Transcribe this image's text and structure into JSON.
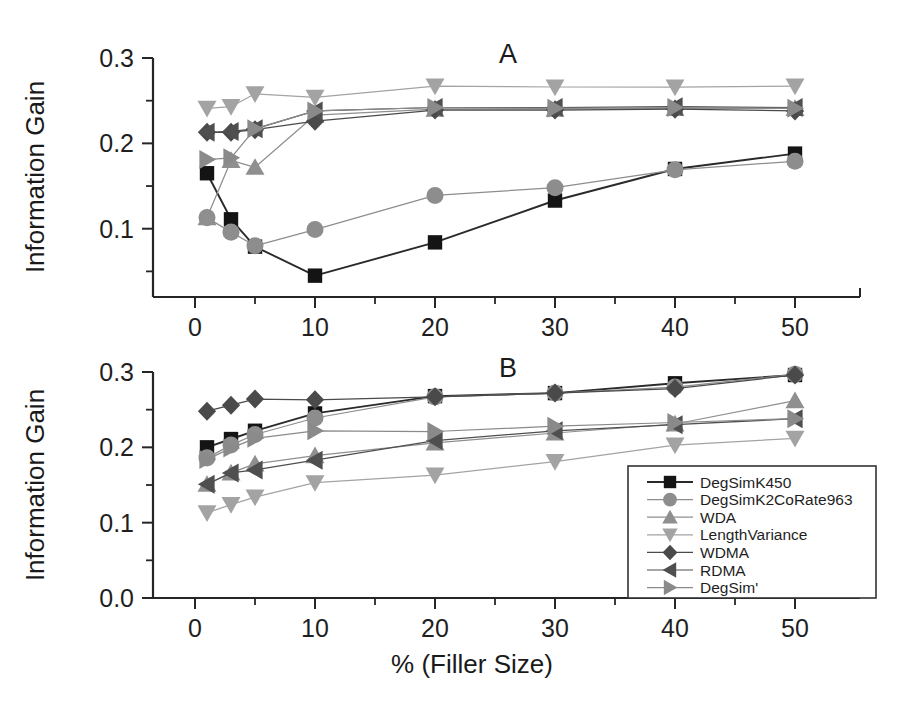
{
  "figure": {
    "width": 901,
    "height": 711,
    "background": "#ffffff"
  },
  "axis_labels": {
    "y_title": "Information Gain",
    "x_title": "% (Filler Size)"
  },
  "panels": [
    {
      "id": "A",
      "letter": "A"
    },
    {
      "id": "B",
      "letter": "B"
    }
  ],
  "legend": {
    "position": "bottom-right",
    "entries": [
      {
        "label": "DegSimK450",
        "marker": "square",
        "color": "#141414"
      },
      {
        "label": "DegSimK2CoRate963",
        "marker": "circle",
        "color": "#8d8d8d"
      },
      {
        "label": "WDA",
        "marker": "triangle-up",
        "color": "#8f8f8f"
      },
      {
        "label": "LengthVariance",
        "marker": "triangle-down",
        "color": "#a3a3a3"
      },
      {
        "label": "WDMA",
        "marker": "diamond",
        "color": "#4a4a4a"
      },
      {
        "label": "RDMA",
        "marker": "triangle-left",
        "color": "#4f4f4f"
      },
      {
        "label": "DegSim'",
        "marker": "triangle-right",
        "color": "#8a8a8a"
      }
    ]
  },
  "chart_data": [
    {
      "type": "line",
      "panel": "A",
      "title": "A",
      "xlabel": "% (Filler Size)",
      "ylabel": "Information Gain",
      "x": [
        1,
        3,
        5,
        10,
        20,
        30,
        40,
        50
      ],
      "xlim": [
        -2,
        54
      ],
      "ylim": [
        0.02,
        0.3
      ],
      "xticks": [
        0,
        10,
        20,
        30,
        40,
        50
      ],
      "yticks": [
        0.1,
        0.2,
        0.3
      ],
      "yticklabels": [
        "0.1",
        "0.2",
        "0.3"
      ],
      "minor_xticks": [
        5,
        15,
        25,
        35,
        45
      ],
      "minor_yticks": [
        0.05,
        0.15,
        0.25
      ],
      "grid": false,
      "legend": false,
      "series": [
        {
          "name": "DegSimK450",
          "marker": "square",
          "color": "#141414",
          "values": [
            0.165,
            0.111,
            0.079,
            0.045,
            0.084,
            0.133,
            0.17,
            0.188
          ]
        },
        {
          "name": "DegSimK2CoRate963",
          "marker": "circle",
          "color": "#8d8d8d",
          "values": [
            0.113,
            0.096,
            0.08,
            0.099,
            0.139,
            0.148,
            0.169,
            0.179
          ]
        },
        {
          "name": "WDA",
          "marker": "triangle-up",
          "color": "#8f8f8f",
          "values": [
            0.113,
            0.18,
            0.172,
            0.233,
            0.24,
            0.24,
            0.241,
            0.241
          ]
        },
        {
          "name": "LengthVariance",
          "marker": "triangle-down",
          "color": "#a3a3a3",
          "values": [
            0.241,
            0.243,
            0.258,
            0.254,
            0.267,
            0.266,
            0.266,
            0.267
          ]
        },
        {
          "name": "WDMA",
          "marker": "diamond",
          "color": "#4a4a4a",
          "values": [
            0.213,
            0.213,
            0.216,
            0.226,
            0.239,
            0.239,
            0.24,
            0.238
          ]
        },
        {
          "name": "RDMA",
          "marker": "triangle-left",
          "color": "#4f4f4f",
          "values": [
            0.213,
            0.214,
            0.217,
            0.238,
            0.242,
            0.242,
            0.243,
            0.242
          ]
        },
        {
          "name": "DegSim'",
          "marker": "triangle-right",
          "color": "#8a8a8a",
          "values": [
            0.181,
            0.183,
            0.217,
            0.238,
            0.242,
            0.241,
            0.242,
            0.241
          ]
        }
      ]
    },
    {
      "type": "line",
      "panel": "B",
      "title": "B",
      "xlabel": "% (Filler Size)",
      "ylabel": "Information Gain",
      "x": [
        1,
        3,
        5,
        10,
        20,
        30,
        40,
        50
      ],
      "xlim": [
        -2,
        54
      ],
      "ylim": [
        0.0,
        0.3
      ],
      "xticks": [
        0,
        10,
        20,
        30,
        40,
        50
      ],
      "yticks": [
        0.0,
        0.1,
        0.2,
        0.3
      ],
      "yticklabels": [
        "0.0",
        "0.1",
        "0.2",
        "0.3"
      ],
      "minor_xticks": [
        5,
        15,
        25,
        35,
        45
      ],
      "minor_yticks": [
        0.05,
        0.15,
        0.25
      ],
      "grid": false,
      "legend": true,
      "series": [
        {
          "name": "DegSimK450",
          "marker": "square",
          "color": "#141414",
          "values": [
            0.2,
            0.211,
            0.222,
            0.245,
            0.268,
            0.272,
            0.285,
            0.296
          ]
        },
        {
          "name": "DegSimK2CoRate963",
          "marker": "circle",
          "color": "#8d8d8d",
          "values": [
            0.186,
            0.203,
            0.217,
            0.239,
            0.267,
            0.272,
            0.28,
            0.297
          ]
        },
        {
          "name": "WDA",
          "marker": "triangle-up",
          "color": "#8f8f8f",
          "values": [
            0.151,
            0.166,
            0.178,
            0.189,
            0.206,
            0.219,
            0.231,
            0.262
          ]
        },
        {
          "name": "LengthVariance",
          "marker": "triangle-down",
          "color": "#a3a3a3",
          "values": [
            0.113,
            0.124,
            0.134,
            0.153,
            0.163,
            0.181,
            0.203,
            0.212
          ]
        },
        {
          "name": "WDMA",
          "marker": "diamond",
          "color": "#4a4a4a",
          "values": [
            0.248,
            0.256,
            0.264,
            0.263,
            0.267,
            0.272,
            0.278,
            0.296
          ]
        },
        {
          "name": "RDMA",
          "marker": "triangle-left",
          "color": "#4f4f4f",
          "values": [
            0.151,
            0.166,
            0.17,
            0.183,
            0.209,
            0.222,
            0.23,
            0.238
          ]
        },
        {
          "name": "DegSim'",
          "marker": "triangle-right",
          "color": "#8a8a8a",
          "values": [
            0.184,
            0.199,
            0.212,
            0.222,
            0.221,
            0.228,
            0.233,
            0.238
          ]
        }
      ]
    }
  ]
}
